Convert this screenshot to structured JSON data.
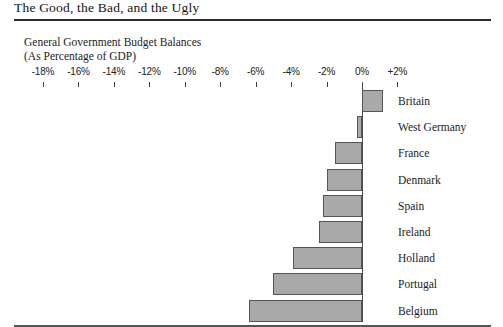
{
  "figure": {
    "title": "The Good, the Bad, and the Ugly"
  },
  "chart_data": {
    "type": "bar",
    "orientation": "horizontal",
    "title": "General Government Budget Balances",
    "subtitle": "(As Percentage of GDP)",
    "xlabel": "",
    "ylabel": "",
    "xlim": [
      -19,
      3
    ],
    "grid": false,
    "legend": null,
    "tick_labels": [
      "-18%",
      "-16%",
      "-14%",
      "-12%",
      "-10%",
      "-8%",
      "-6%",
      "-4%",
      "-2%",
      "0%",
      "+2%"
    ],
    "tick_values": [
      -18,
      -16,
      -14,
      -12,
      -10,
      -8,
      -6,
      -4,
      -2,
      0,
      2
    ],
    "categories": [
      "Britain",
      "West Germany",
      "France",
      "Denmark",
      "Spain",
      "Ireland",
      "Holland",
      "Portugal",
      "Belgium"
    ],
    "values": [
      1.2,
      -0.3,
      -1.5,
      -2.0,
      -2.2,
      -2.4,
      -3.9,
      -5.0,
      -6.4
    ],
    "bar_fill_color": "#a9a9a9",
    "bar_border_color": "#555555",
    "axis_color": "#4a4a4a"
  }
}
